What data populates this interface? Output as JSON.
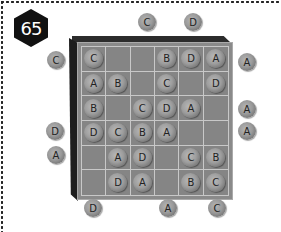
{
  "puzzle": {
    "number": "65",
    "grid": [
      [
        "C",
        "",
        "",
        "B",
        "D",
        "A"
      ],
      [
        "A",
        "B",
        "",
        "C",
        "",
        "D"
      ],
      [
        "B",
        "",
        "C",
        "D",
        "A",
        ""
      ],
      [
        "D",
        "C",
        "B",
        "A",
        "",
        ""
      ],
      [
        "",
        "A",
        "D",
        "",
        "C",
        "B"
      ],
      [
        "",
        "D",
        "A",
        "",
        "B",
        "C"
      ]
    ],
    "clues": {
      "top": [
        {
          "label": "C",
          "x": 138,
          "y": 13
        },
        {
          "label": "D",
          "x": 184,
          "y": 13
        }
      ],
      "left": [
        {
          "label": "C",
          "x": 47,
          "y": 51
        },
        {
          "label": "D",
          "x": 46,
          "y": 122
        },
        {
          "label": "A",
          "x": 47,
          "y": 146
        }
      ],
      "right": [
        {
          "label": "A",
          "x": 238,
          "y": 53
        },
        {
          "label": "A",
          "x": 238,
          "y": 100
        },
        {
          "label": "A",
          "x": 238,
          "y": 122
        }
      ],
      "bottom": [
        {
          "label": "D",
          "x": 84,
          "y": 199
        },
        {
          "label": "A",
          "x": 159,
          "y": 199
        },
        {
          "label": "C",
          "x": 208,
          "y": 199
        }
      ]
    }
  }
}
